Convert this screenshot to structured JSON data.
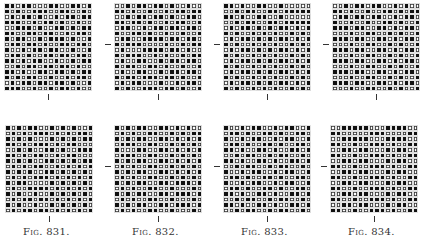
{
  "figures": [
    {
      "id": "831",
      "caption": "Fig. 831.",
      "top": {
        "x": 4,
        "y": 3,
        "pattern": [
          "1101100011001101",
          "1010011100110010",
          "0101101001011011",
          "1110010110100100",
          "0011101001101011",
          "1100110110010110",
          "1011001011101001",
          "0110110100110110",
          "1001011011001001",
          "0110100110110110",
          "1101011001001011",
          "0010110110110100",
          "1101001101101011",
          "1010110010010110",
          "0101101101101001",
          "1110010010110100"
        ]
      },
      "bottom": {
        "x": 5,
        "y": 125,
        "pattern": [
          "1010110010101001",
          "0101011101010110",
          "1010100010101011",
          "1101011101011000",
          "0010100110100111",
          "1101011001011000",
          "1010100110101011",
          "0101011001010101",
          "1010100110101010",
          "0101011101010101",
          "1011000010101010",
          "0100111101010101",
          "1010010010101010",
          "0101101101010101",
          "1010010010101010",
          "0101101101010101"
        ]
      }
    },
    {
      "id": "832",
      "caption": "Fig. 832.",
      "top": {
        "x": 114,
        "y": 3,
        "pattern": [
          "0010110110100100",
          "1101001001011011",
          "0010110110100110",
          "1101101001011001",
          "0110010110110110",
          "1001101001001001",
          "0110011110110110",
          "1011100001001011",
          "0100011110110100",
          "1011100101001011",
          "0100110010110110",
          "1011001101001001",
          "0100110010110110",
          "1011011101101001",
          "0101100010010110",
          "1010011101101001"
        ]
      },
      "bottom": {
        "x": 114,
        "y": 125,
        "pattern": [
          "1010110011010100",
          "0101001100101011",
          "1010110011010101",
          "0111001100101010",
          "1000110011010101",
          "0111001100101010",
          "1010110011010101",
          "0101001100101010",
          "1010110011010101",
          "0101001100101010",
          "1010110011011101",
          "0101001100100010",
          "1010110011011101",
          "0101001100100010",
          "1010110011011101",
          "0101001100100010"
        ]
      }
    },
    {
      "id": "833",
      "caption": "Fig. 833.",
      "top": {
        "x": 223,
        "y": 3,
        "pattern": [
          "1101001100100000",
          "0010110011011111",
          "1101001100100000",
          "0010110011011111",
          "0101101010110101",
          "1010010101001010",
          "0101101010110101",
          "1010010101001010",
          "0101101010110101",
          "1010010101001010",
          "0101101010110101",
          "1010010101001010",
          "0101101010110101",
          "1010010101001010",
          "0101101010110101",
          "1010010101001010"
        ]
      },
      "bottom": {
        "x": 223,
        "y": 125,
        "pattern": [
          "1001011001011001",
          "0110100110100110",
          "1001011001011001",
          "0110100110100110",
          "1101001101001101",
          "0010110010110010",
          "1101001101001101",
          "0010110010110010",
          "1001011001011001",
          "0110100110100110",
          "1001011001011001",
          "0110100110100110",
          "1101001101001101",
          "0010110010110010",
          "1101001101001101",
          "0010110010110010"
        ]
      }
    },
    {
      "id": "834",
      "caption": "Fig. 834.",
      "top": {
        "x": 332,
        "y": 3,
        "pattern": [
          "0010110110010100",
          "1101001001101011",
          "0110110110010110",
          "1001001001101001",
          "1110110011010110",
          "0001001100101001",
          "1110110011010110",
          "0001001100101001",
          "1110110011010110",
          "0001001100101001",
          "1110110011010110",
          "0001001100101001",
          "1110110011010110",
          "0001001100101001",
          "1110110011010110",
          "0001001100101001"
        ]
      },
      "bottom": {
        "x": 330,
        "y": 125,
        "pattern": [
          "0011111000111100",
          "1100000111000011",
          "0011111000111100",
          "1100100111010011",
          "0011011000101100",
          "1100100111010011",
          "0011011000101100",
          "1100100111010011",
          "0011011000101100",
          "1100100111010011",
          "0011011000101100",
          "1100100111010011",
          "0011011000101100",
          "1100100111010011",
          "0011011000101100",
          "1100100111010011"
        ]
      }
    }
  ],
  "grid": {
    "rows": 16,
    "cols": 16,
    "cell_px": 5.5
  }
}
